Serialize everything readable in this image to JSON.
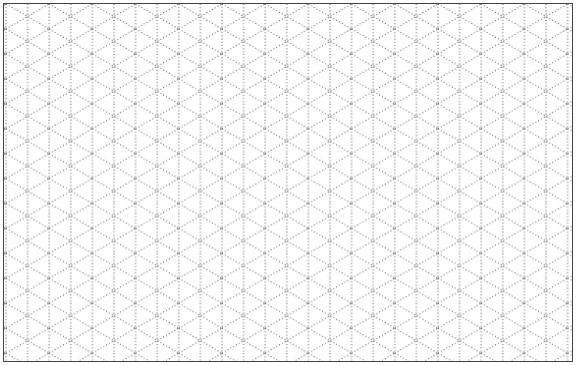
{
  "grid": {
    "type": "isometric-dotted-grid",
    "line_color": "#555555",
    "border_color": "#444444",
    "background": "#ffffff",
    "spacing_px": 21.6
  }
}
